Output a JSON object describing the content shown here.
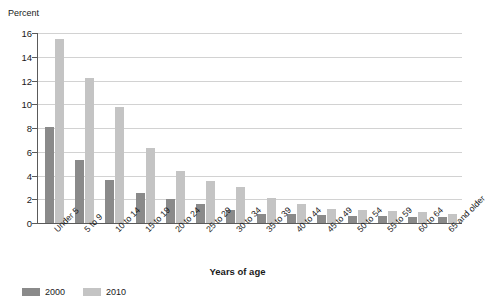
{
  "chart_data": {
    "type": "bar",
    "title": "",
    "subtitle": "",
    "xlabel": "Years of age",
    "ylabel": "Percent",
    "ylim": [
      0,
      16
    ],
    "ytick_step": 2,
    "yticks": [
      0,
      2,
      4,
      6,
      8,
      10,
      12,
      14,
      16
    ],
    "grid": true,
    "grid_axis": "y",
    "legend_position": "bottom-left",
    "categories": [
      "Under 5",
      "5 to 9",
      "10 to 14",
      "15 to 19",
      "20 to 24",
      "25 to 29",
      "30 to 34",
      "35 to 39",
      "40 to 44",
      "45 to 49",
      "50 to 54",
      "55 to 59",
      "60 to 64",
      "65 and older"
    ],
    "series": [
      {
        "name": "2000",
        "color": "#8a8a8a",
        "values": [
          8.1,
          5.3,
          3.6,
          2.5,
          2.0,
          1.6,
          1.1,
          0.8,
          0.8,
          0.7,
          0.6,
          0.6,
          0.5,
          0.5
        ]
      },
      {
        "name": "2010",
        "color": "#c4c4c4",
        "values": [
          15.5,
          12.2,
          9.8,
          6.3,
          4.4,
          3.5,
          3.0,
          2.1,
          1.6,
          1.2,
          1.1,
          1.0,
          0.9,
          0.8
        ]
      }
    ]
  },
  "axis": {
    "y_title": "Percent",
    "x_title": "Years of age",
    "ytick_labels": [
      "16",
      "14",
      "12",
      "10",
      "8",
      "6",
      "4",
      "2",
      "0"
    ]
  },
  "legend": {
    "items": [
      {
        "label": "2000",
        "color": "#8a8a8a"
      },
      {
        "label": "2010",
        "color": "#c4c4c4"
      }
    ]
  },
  "style": {
    "gridline_color": "#d2d2d2",
    "axis_color": "#5a5a5a",
    "text_color": "#1a1a1a",
    "background": "#ffffff"
  }
}
